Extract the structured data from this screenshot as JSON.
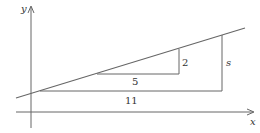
{
  "diagram": {
    "type": "slope-triangles",
    "axes": {
      "x_label": "x",
      "y_label": "y"
    },
    "line": {
      "description": "straight line with positive slope crossing the y-axis"
    },
    "small_triangle": {
      "run_label": "5",
      "rise_label": "2"
    },
    "large_triangle": {
      "run_label": "11",
      "rise_label": "s"
    },
    "colors": {
      "stroke": "#666666",
      "text": "#333333",
      "background": "#ffffff"
    }
  }
}
